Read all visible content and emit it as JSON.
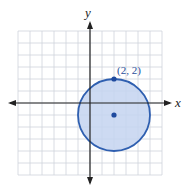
{
  "figure": {
    "type": "coordinate-plane-circle",
    "axes": {
      "x_label": "x",
      "y_label": "y",
      "x_range": [
        -6,
        6
      ],
      "y_range": [
        -6,
        6
      ],
      "grid": true
    },
    "circle": {
      "center": [
        2,
        -1
      ],
      "radius": 3,
      "fill": "#c4d4f0",
      "stroke": "#2f5fb0"
    },
    "points": [
      {
        "label": "(2, 2)",
        "x": 2,
        "y": 2,
        "labeled": true
      },
      {
        "label": "",
        "x": 2,
        "y": -1,
        "labeled": false
      }
    ],
    "colors": {
      "grid": "#cfd3dc",
      "axis": "#222222",
      "point": "#1f4a9e"
    }
  }
}
